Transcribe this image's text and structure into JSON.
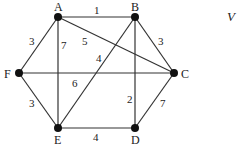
{
  "graph": {
    "nodes": [
      {
        "id": "A",
        "x": 58,
        "y": 17,
        "lx": 54,
        "ly": 1
      },
      {
        "id": "B",
        "x": 135,
        "y": 17,
        "lx": 131,
        "ly": 1
      },
      {
        "id": "C",
        "x": 174,
        "y": 73,
        "lx": 181,
        "ly": 68
      },
      {
        "id": "D",
        "x": 135,
        "y": 128,
        "lx": 131,
        "ly": 134
      },
      {
        "id": "E",
        "x": 58,
        "y": 128,
        "lx": 54,
        "ly": 134
      },
      {
        "id": "F",
        "x": 19,
        "y": 73,
        "lx": 4,
        "ly": 68
      }
    ],
    "edges": [
      {
        "from": "A",
        "to": "B",
        "weight": "1",
        "wx": 94,
        "wy": 5
      },
      {
        "from": "A",
        "to": "F",
        "weight": "3",
        "wx": 29,
        "wy": 36
      },
      {
        "from": "A",
        "to": "E",
        "weight": "7",
        "wx": 61,
        "wy": 40
      },
      {
        "from": "A",
        "to": "C",
        "weight": "5",
        "wx": 82,
        "wy": 36
      },
      {
        "from": "B",
        "to": "C",
        "weight": "3",
        "wx": 158,
        "wy": 36
      },
      {
        "from": "B",
        "to": "E",
        "weight": "4",
        "wx": 96,
        "wy": 53
      },
      {
        "from": "B",
        "to": "D",
        "weight": "2",
        "wx": 127,
        "wy": 94
      },
      {
        "from": "F",
        "to": "C",
        "weight": "6",
        "wx": 72,
        "wy": 78
      },
      {
        "from": "F",
        "to": "E",
        "weight": "3",
        "wx": 29,
        "wy": 98
      },
      {
        "from": "E",
        "to": "D",
        "weight": "4",
        "wx": 93,
        "wy": 132
      },
      {
        "from": "C",
        "to": "D",
        "weight": "7",
        "wx": 160,
        "wy": 98
      }
    ]
  },
  "side_text": "V"
}
